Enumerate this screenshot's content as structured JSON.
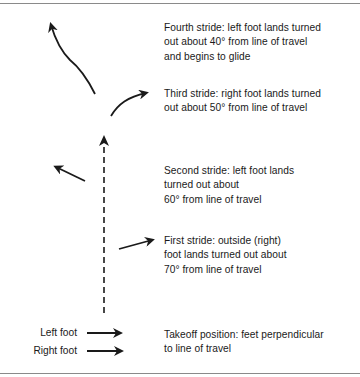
{
  "diagram": {
    "steps": [
      {
        "id": "fourth",
        "text_lines": [
          "Fourth stride: left foot lands turned",
          "out about 40° from line of travel",
          "and begins to glide"
        ]
      },
      {
        "id": "third",
        "text_lines": [
          "Third stride: right foot lands turned",
          "out about 50° from line of travel"
        ]
      },
      {
        "id": "second",
        "text_lines": [
          "Second stride: left foot lands",
          "turned out about",
          "60° from line of travel"
        ]
      },
      {
        "id": "first",
        "text_lines": [
          "First stride: outside (right)",
          "foot lands turned out about",
          "70° from line of travel"
        ]
      },
      {
        "id": "takeoff",
        "text_lines": [
          "Takeoff position: feet perpendicular",
          "to line of travel"
        ]
      }
    ],
    "foot_labels": {
      "left": "Left foot",
      "right": "Right foot"
    },
    "line_of_travel": "dashed vertical arrow",
    "colors": {
      "ink": "#1a1a1a",
      "rule": "#8a8a8a",
      "background": "#ffffff"
    }
  }
}
